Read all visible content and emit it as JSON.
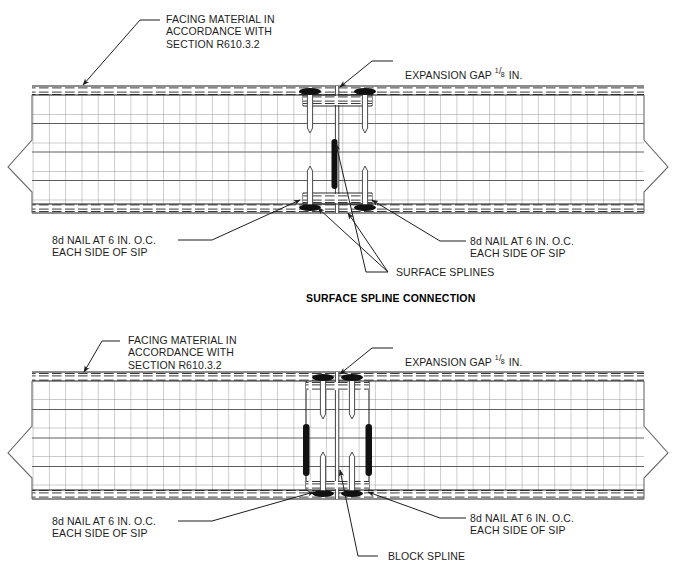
{
  "drawing": {
    "title_main": "SURFACE SPLINE CONNECTION",
    "subject": "SIP panel spline connection details",
    "line_color": "#1d1d1d",
    "grid_color": "#8e8e8e",
    "spline_fill": "#111111"
  },
  "top_detail": {
    "name": "surface-spline-connection",
    "labels": {
      "facing": "FACING MATERIAL IN\nACCORDANCE WITH\nSECTION R610.3.2",
      "expansion_gap_pre": "EXPANSION GAP ",
      "expansion_gap_num": "1",
      "expansion_gap_den": "8",
      "expansion_gap_post": " IN.",
      "nail_left": "8d NAIL AT 6 IN. O.C.\nEACH SIDE OF SIP",
      "nail_right": "8d NAIL AT 6 IN. O.C.\nEACH SIDE OF SIP",
      "splines": "SURFACE SPLINES"
    }
  },
  "bottom_detail": {
    "name": "block-spline-connection",
    "labels": {
      "facing": "FACING MATERIAL IN\nACCORDANCE WITH\nSECTION R610.3.2",
      "expansion_gap_pre": "EXPANSION GAP ",
      "expansion_gap_num": "1",
      "expansion_gap_den": "8",
      "expansion_gap_post": " IN.",
      "nail_left": "8d NAIL AT 6 IN. O.C.\nEACH SIDE OF SIP",
      "nail_right": "8d NAIL AT 6 IN. O.C.\nEACH SIDE OF SIP",
      "block_spline": "BLOCK SPLINE"
    }
  }
}
